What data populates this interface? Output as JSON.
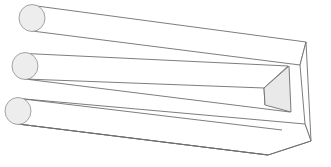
{
  "figure": {
    "canvas": {
      "width": 331,
      "height": 167,
      "background": "#ffffff"
    },
    "style": {
      "stroke": "#6e6e6e",
      "stroke_width": 0.9,
      "face_fill": "#ffffff",
      "shaded_face_fill": "#e9e9e9",
      "prong_cap_fill": "#ededed",
      "prong_cap_stroke": "#9a9a9a"
    },
    "prongs": [
      {
        "name": "top-prong",
        "cap_center": {
          "x": 32,
          "y": 18
        },
        "cap_rx": 13,
        "cap_ry": 13.5,
        "top_line": {
          "x1": 33,
          "y1": 5.5,
          "x2": 306,
          "y2": 42
        },
        "bottom_line": {
          "x1": 32,
          "y1": 31,
          "x2": 300,
          "y2": 65
        }
      },
      {
        "name": "middle-prong",
        "cap_center": {
          "x": 25,
          "y": 66
        },
        "cap_rx": 13,
        "cap_ry": 13.5,
        "top_line": {
          "x1": 26,
          "y1": 53.5,
          "x2": 288,
          "y2": 66
        },
        "bottom_line": {
          "x1": 25,
          "y1": 79,
          "x2": 290,
          "y2": 112
        }
      },
      {
        "name": "bottom-prong",
        "cap_center": {
          "x": 18,
          "y": 111
        },
        "cap_rx": 13,
        "cap_ry": 13.5,
        "top_line": {
          "x1": 19,
          "y1": 98.5,
          "x2": 282,
          "y2": 130
        },
        "bottom_line": {
          "x1": 18,
          "y1": 124,
          "x2": 268,
          "y2": 155
        }
      }
    ],
    "body": {
      "name": "rectangular-block",
      "top_face": [
        {
          "x": 33,
          "y": 5.5
        },
        {
          "x": 306,
          "y": 42
        },
        {
          "x": 300,
          "y": 65
        },
        {
          "x": 32,
          "y": 31
        }
      ],
      "front_face": [
        {
          "x": 300,
          "y": 65
        },
        {
          "x": 306,
          "y": 42
        },
        {
          "x": 311,
          "y": 141
        },
        {
          "x": 305,
          "y": 124
        }
      ],
      "right_edge": {
        "x1": 306,
        "y1": 42,
        "x2": 311,
        "y2": 141
      },
      "bottom_diagonal": {
        "x1": 311,
        "y1": 141,
        "x2": 268,
        "y2": 155
      },
      "lower_long_edge": {
        "x1": 18,
        "y1": 124,
        "x2": 268,
        "y2": 155
      },
      "mid_long_edge": {
        "x1": 19,
        "y1": 98.5,
        "x2": 305,
        "y2": 124
      }
    },
    "shaded_face": {
      "name": "shaded-end-face",
      "points": [
        {
          "x": 289,
          "y": 66
        },
        {
          "x": 264,
          "y": 88
        },
        {
          "x": 265,
          "y": 105
        },
        {
          "x": 291,
          "y": 112
        }
      ]
    },
    "slot": {
      "name": "inner-slot",
      "upper_edge": {
        "x1": 26,
        "y1": 53.5,
        "x2": 288,
        "y2": 66
      },
      "lower_edge": {
        "x1": 25,
        "y1": 79,
        "x2": 290,
        "y2": 112
      },
      "inner_left_edge": {
        "x1": 264,
        "y1": 88,
        "x2": 265,
        "y2": 105
      }
    }
  }
}
